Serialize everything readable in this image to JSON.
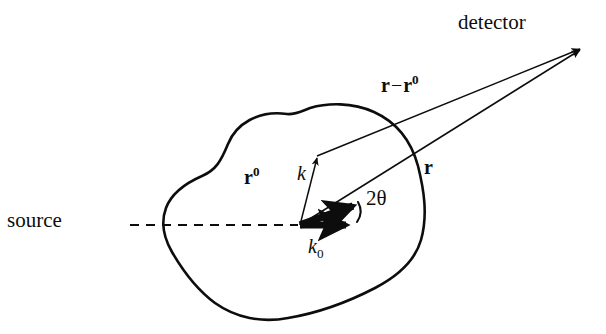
{
  "figure": {
    "background_color": "#ffffff",
    "stroke_color": "#0d0d0d",
    "width": 606,
    "height": 334
  },
  "labels": {
    "detector": "detector",
    "source": "source",
    "r_minus_r0_base": "r",
    "r_minus_r0_minus": "−",
    "r_minus_r0_second": "r",
    "r_minus_r0_sup": "0",
    "r": "r",
    "r0_base": "r",
    "r0_sup": "0",
    "k": "k",
    "k0_base": "k",
    "k0_sub": "0",
    "two_theta": "2θ"
  },
  "geometry": {
    "origin_vertex": [
      300,
      225
    ],
    "detector_point": [
      583,
      47
    ],
    "scatter_point": [
      316,
      155
    ],
    "k0_tip": [
      350,
      225
    ],
    "k_tip": [
      357,
      204
    ],
    "blob_leftmost": [
      164,
      222
    ],
    "dashed_axis_start": [
      130,
      225
    ],
    "dashed_axis_end": [
      298,
      225
    ]
  },
  "icons": {
    "arrowhead": "arrowhead-icon",
    "angle_arc": "angle-arc-icon",
    "dashed_beam": "dashed-beam-icon",
    "sample_blob": "sample-outline-icon"
  }
}
